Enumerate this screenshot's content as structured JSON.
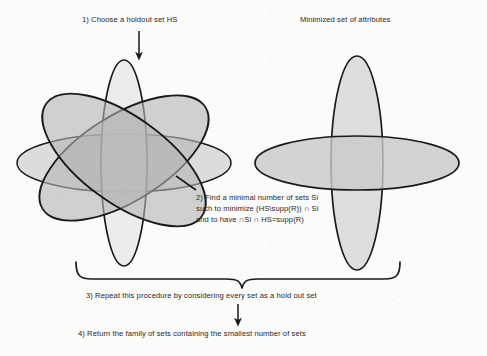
{
  "figure": {
    "title_labels": {
      "left_group": "1) Choose a holdout set HS",
      "right_group": "Minimized set of attributes"
    },
    "steps": [
      {
        "id": "step-1",
        "text": "1) Choose a holdout set HS"
      },
      {
        "id": "step-2",
        "lines": [
          "2) Find a minimal number of sets Si",
          "such to minimize (HS\\supp(R)) ∩ Si",
          "and to have ∩Si ∩ HS=supp(R)"
        ]
      },
      {
        "id": "step-3",
        "text": "3) Repeat this procedure by considering every set as a hold out set"
      },
      {
        "id": "step-4",
        "text": "4) Return the family of sets containing the smallest number of sets"
      }
    ],
    "colors": {
      "stroke": "#1a1a1a",
      "fill_light": "#dedede",
      "fill_mid": "#c2c2c2",
      "fill_dark": "#a8a8a8",
      "background": "#fbfbfa",
      "text": "#2a2a2a"
    },
    "left_diagram": {
      "name": "overlapping-set-ellipses",
      "ellipse_count": 4,
      "ellipses": [
        {
          "name": "vertical-holdout-ellipse",
          "cx": 124,
          "cy": 163,
          "rx": 23,
          "ry": 103,
          "rotate": 0
        },
        {
          "name": "horizontal-ellipse",
          "cx": 124,
          "cy": 163,
          "rx": 107,
          "ry": 29,
          "rotate": 0
        },
        {
          "name": "diagonal-ellipse-a",
          "cx": 124,
          "cy": 158,
          "rx": 96,
          "ry": 43,
          "rotate": -32
        },
        {
          "name": "diagonal-ellipse-b",
          "cx": 124,
          "cy": 160,
          "rx": 96,
          "ry": 43,
          "rotate": 36
        }
      ]
    },
    "right_diagram": {
      "name": "minimized-set-ellipses",
      "ellipse_count": 2,
      "ellipses": [
        {
          "name": "vertical-ellipse",
          "cx": 357,
          "cy": 163,
          "rx": 26,
          "ry": 107,
          "rotate": 0
        },
        {
          "name": "horizontal-ellipse",
          "cx": 357,
          "cy": 163,
          "rx": 102,
          "ry": 27,
          "rotate": 0
        }
      ]
    },
    "connectors": {
      "step1_arrow": "down-arrow",
      "step2_leader": "diagonal-leader-line",
      "brace": "curly-brace-spanning-both-diagrams",
      "step3_to_step4_arrow": "down-arrow"
    }
  }
}
